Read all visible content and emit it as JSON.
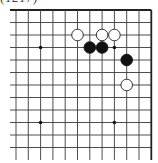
{
  "caption": "(1217)",
  "board": {
    "cols": 12,
    "rows": 12,
    "origin_x": 16,
    "origin_y": 10,
    "step_x": 12.3,
    "step_y": 12.5,
    "open_left": true,
    "open_bottom": true,
    "line_color": "#3a3a3a",
    "border_color": "#222222"
  },
  "star_points": [
    [
      2,
      3
    ],
    [
      8,
      3
    ],
    [
      2,
      9
    ],
    [
      8,
      9
    ]
  ],
  "stones": [
    {
      "color": "white",
      "col": 5,
      "row": 2
    },
    {
      "color": "white",
      "col": 7,
      "row": 2
    },
    {
      "color": "white",
      "col": 8,
      "row": 2
    },
    {
      "color": "black",
      "col": 6,
      "row": 3
    },
    {
      "color": "black",
      "col": 7,
      "row": 3
    },
    {
      "color": "black",
      "col": 9,
      "row": 4
    },
    {
      "color": "white",
      "col": 9,
      "row": 6
    }
  ]
}
